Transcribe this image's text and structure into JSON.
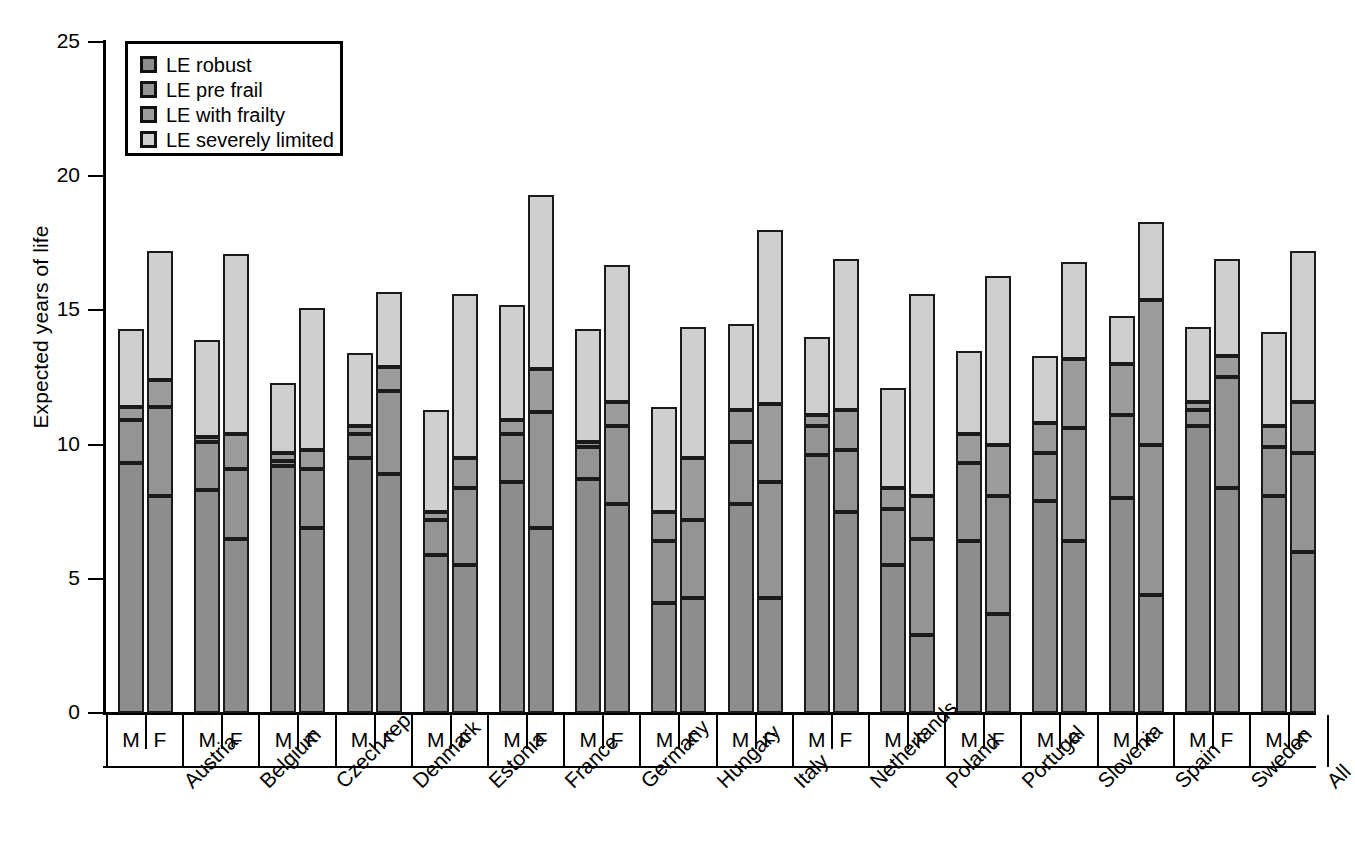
{
  "chart_data": {
    "type": "bar",
    "subtype": "stacked-grouped",
    "title": "",
    "xlabel": "",
    "ylabel": "Expected years of life",
    "ylim": [
      0,
      25
    ],
    "yticks": [
      0,
      5,
      10,
      15,
      20,
      25
    ],
    "grid": false,
    "legend_position": "top-left",
    "legend": [
      "LE robust",
      "LE pre frail",
      "LE with frailty",
      "LE severely limited"
    ],
    "series_colors": [
      "#8d8d8d",
      "#949494",
      "#9c9c9c",
      "#cfcfcf"
    ],
    "categories": [
      "Austria",
      "Belgium",
      "Czech rep",
      "Denmark",
      "Estonia",
      "France",
      "Germany",
      "Hungary",
      "Italy",
      "Netherlands",
      "Poland",
      "Portugal",
      "Slovenia",
      "Spain",
      "Sweden",
      "All"
    ],
    "sexes": [
      "M",
      "F"
    ],
    "note": "Values are cumulative segment boundaries in years; each bar is a stack of 4 segments (LE robust, LE pre frail, LE with frailty, LE severely limited).",
    "groups": [
      {
        "country": "Austria",
        "M": {
          "segments": [
            9.3,
            1.6,
            0.5,
            2.9
          ],
          "cum": [
            9.3,
            10.9,
            11.4,
            14.3
          ],
          "total": 14.3
        },
        "F": {
          "segments": [
            8.1,
            3.3,
            1.0,
            4.8
          ],
          "cum": [
            8.1,
            11.4,
            12.4,
            17.2
          ],
          "total": 17.2
        }
      },
      {
        "country": "Belgium",
        "M": {
          "segments": [
            8.3,
            1.8,
            0.2,
            3.6
          ],
          "cum": [
            8.3,
            10.1,
            10.3,
            13.9
          ],
          "total": 13.9
        },
        "F": {
          "segments": [
            6.5,
            2.6,
            1.3,
            6.7
          ],
          "cum": [
            6.5,
            9.1,
            10.4,
            17.1
          ],
          "total": 17.1
        }
      },
      {
        "country": "Czech rep",
        "M": {
          "segments": [
            9.2,
            0.2,
            0.3,
            2.6
          ],
          "cum": [
            9.2,
            9.4,
            9.7,
            12.3
          ],
          "total": 12.3
        },
        "F": {
          "segments": [
            6.9,
            2.2,
            0.7,
            5.3
          ],
          "cum": [
            6.9,
            9.1,
            9.8,
            15.1
          ],
          "total": 15.1
        }
      },
      {
        "country": "Denmark",
        "M": {
          "segments": [
            9.5,
            0.9,
            0.3,
            2.7
          ],
          "cum": [
            9.5,
            10.4,
            10.7,
            13.4
          ],
          "total": 13.4
        },
        "F": {
          "segments": [
            8.9,
            3.1,
            0.9,
            2.8
          ],
          "cum": [
            8.9,
            12.0,
            12.9,
            15.7
          ],
          "total": 15.7
        }
      },
      {
        "country": "Estonia",
        "M": {
          "segments": [
            5.9,
            1.3,
            0.3,
            3.8
          ],
          "cum": [
            5.9,
            7.2,
            7.5,
            11.3
          ],
          "total": 11.3
        },
        "F": {
          "segments": [
            5.5,
            2.9,
            1.1,
            6.1
          ],
          "cum": [
            5.5,
            8.4,
            9.5,
            15.6
          ],
          "total": 15.6
        }
      },
      {
        "country": "France",
        "M": {
          "segments": [
            8.6,
            1.8,
            0.5,
            4.3
          ],
          "cum": [
            8.6,
            10.4,
            10.9,
            15.2
          ],
          "total": 15.2
        },
        "F": {
          "segments": [
            6.9,
            4.3,
            1.6,
            6.5
          ],
          "cum": [
            6.9,
            11.2,
            12.8,
            19.3
          ],
          "total": 19.3
        }
      },
      {
        "country": "Germany",
        "M": {
          "segments": [
            8.7,
            1.2,
            0.2,
            4.2
          ],
          "cum": [
            8.7,
            9.9,
            10.1,
            14.3
          ],
          "total": 14.3
        },
        "F": {
          "segments": [
            7.8,
            2.9,
            0.9,
            5.1
          ],
          "cum": [
            7.8,
            10.7,
            11.6,
            16.7
          ],
          "total": 16.7
        }
      },
      {
        "country": "Hungary",
        "M": {
          "segments": [
            4.1,
            2.3,
            1.1,
            3.9
          ],
          "cum": [
            4.1,
            6.4,
            7.5,
            11.4
          ],
          "total": 11.4
        },
        "F": {
          "segments": [
            4.3,
            2.9,
            2.3,
            4.9
          ],
          "cum": [
            4.3,
            7.2,
            9.5,
            14.3
          ],
          "total": 14.3
        }
      },
      {
        "country": "Italy",
        "M": {
          "segments": [
            7.8,
            2.3,
            1.2,
            3.2
          ],
          "cum": [
            7.8,
            10.1,
            11.3,
            14.5
          ],
          "total": 14.5
        },
        "F": {
          "segments": [
            4.3,
            4.3,
            2.9,
            6.5
          ],
          "cum": [
            4.3,
            8.6,
            11.5,
            17.8
          ],
          "total": 17.8
        }
      },
      {
        "country": "Netherlands",
        "M": {
          "segments": [
            9.6,
            1.1,
            0.4,
            2.9
          ],
          "cum": [
            9.6,
            10.7,
            11.1,
            14.0
          ],
          "total": 14.0
        },
        "F": {
          "segments": [
            7.5,
            2.3,
            1.5,
            5.6
          ],
          "cum": [
            7.5,
            9.8,
            11.3,
            16.9
          ],
          "total": 16.9
        }
      },
      {
        "country": "Poland",
        "M": {
          "segments": [
            5.5,
            2.1,
            0.8,
            3.7
          ],
          "cum": [
            5.5,
            7.6,
            8.4,
            12.1
          ],
          "total": 12.1
        },
        "F": {
          "segments": [
            2.9,
            3.6,
            1.6,
            7.5
          ],
          "cum": [
            2.9,
            6.5,
            8.1,
            15.6
          ],
          "total": 15.6
        }
      },
      {
        "country": "Portugal",
        "M": {
          "segments": [
            6.4,
            2.9,
            1.1,
            3.1
          ],
          "cum": [
            6.4,
            9.3,
            10.4,
            13.5
          ],
          "total": 13.5
        },
        "F": {
          "segments": [
            3.7,
            4.4,
            1.9,
            6.3
          ],
          "cum": [
            3.7,
            8.1,
            10.0,
            16.3
          ],
          "total": 16.3
        }
      },
      {
        "country": "Slovenia",
        "M": {
          "segments": [
            7.9,
            1.8,
            1.1,
            2.5
          ],
          "cum": [
            7.9,
            9.7,
            10.8,
            13.3
          ],
          "total": 13.3
        },
        "F": {
          "segments": [
            6.4,
            4.2,
            2.6,
            3.6
          ],
          "cum": [
            6.4,
            10.6,
            13.2,
            16.8
          ],
          "total": 16.8
        }
      },
      {
        "country": "Spain",
        "M": {
          "segments": [
            8.0,
            3.1,
            1.9,
            1.8
          ],
          "cum": [
            8.0,
            11.1,
            13.0,
            14.8
          ],
          "total": 14.8
        },
        "F": {
          "segments": [
            4.4,
            5.6,
            5.4,
            2.9
          ],
          "cum": [
            4.4,
            10.0,
            15.4,
            18.3
          ],
          "total": 18.3
        }
      },
      {
        "country": "Sweden",
        "M": {
          "segments": [
            10.7,
            0.6,
            0.3,
            2.8
          ],
          "cum": [
            10.7,
            11.3,
            11.6,
            14.4
          ],
          "total": 14.4
        },
        "F": {
          "segments": [
            8.4,
            4.1,
            0.8,
            3.6
          ],
          "cum": [
            8.4,
            12.5,
            13.3,
            16.9
          ],
          "total": 16.9
        }
      },
      {
        "country": "All",
        "M": {
          "segments": [
            8.1,
            1.8,
            0.8,
            3.5
          ],
          "cum": [
            8.1,
            9.9,
            10.7,
            14.2
          ],
          "total": 14.2
        },
        "F": {
          "segments": [
            6.0,
            3.7,
            1.9,
            5.6
          ],
          "cum": [
            6.0,
            9.7,
            11.6,
            17.2
          ],
          "total": 17.2
        }
      }
    ]
  }
}
